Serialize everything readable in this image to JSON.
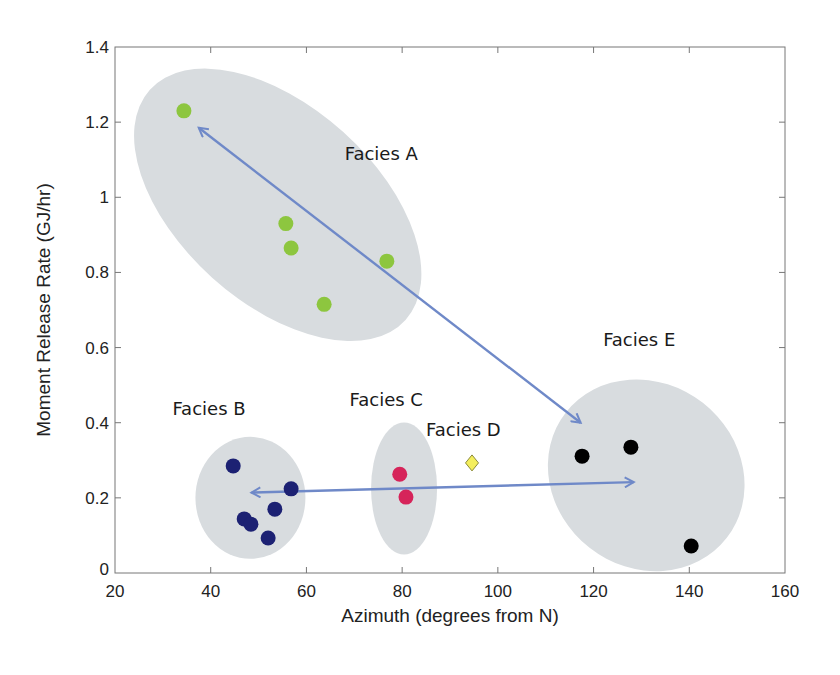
{
  "chart_data": {
    "type": "scatter",
    "title": "",
    "xlabel": "Azimuth (degrees from N)",
    "ylabel": "Moment Release Rate (GJ/hr)",
    "xlim": [
      20,
      160
    ],
    "ylim": [
      0,
      1.4
    ],
    "x_ticks": [
      20,
      40,
      60,
      80,
      100,
      120,
      140,
      160
    ],
    "y_ticks": [
      0,
      0.2,
      0.4,
      0.6,
      0.8,
      1,
      1.2,
      1.4
    ],
    "x_tick_labels": [
      "20",
      "40",
      "60",
      "80",
      "100",
      "120",
      "140",
      "160"
    ],
    "y_tick_labels": [
      "0",
      "0.2",
      "0.4",
      "0.6",
      "0.8",
      "1",
      "1.2",
      "1.4"
    ],
    "grid": false,
    "legend": null,
    "series": [
      {
        "name": "Facies A",
        "marker": "circle",
        "color": "#8dc63f",
        "points": [
          {
            "x": 34.4,
            "y": 1.23
          },
          {
            "x": 55.7,
            "y": 0.93
          },
          {
            "x": 56.8,
            "y": 0.865
          },
          {
            "x": 76.8,
            "y": 0.83
          },
          {
            "x": 63.7,
            "y": 0.715
          }
        ],
        "label_pos": {
          "x": 68,
          "y": 1.1
        },
        "region": {
          "cx": 54,
          "cy": 0.98,
          "rx": 172,
          "ry": 98,
          "rotate": 42
        }
      },
      {
        "name": "Facies B",
        "marker": "circle",
        "color": "#1c2173",
        "points": [
          {
            "x": 44.7,
            "y": 0.285
          },
          {
            "x": 56.8,
            "y": 0.224
          },
          {
            "x": 53.4,
            "y": 0.17
          },
          {
            "x": 47.0,
            "y": 0.144
          },
          {
            "x": 48.4,
            "y": 0.13
          },
          {
            "x": 52.0,
            "y": 0.093
          }
        ],
        "label_pos": {
          "x": 32,
          "y": 0.42
        },
        "region": {
          "cx": 48.3,
          "cy": 0.2,
          "rx": 55,
          "ry": 61,
          "rotate": 0
        }
      },
      {
        "name": "Facies C",
        "marker": "circle",
        "color": "#d6245a",
        "points": [
          {
            "x": 79.5,
            "y": 0.263
          },
          {
            "x": 80.8,
            "y": 0.202
          }
        ],
        "label_pos": {
          "x": 69,
          "y": 0.445
        },
        "region": {
          "cx": 80.4,
          "cy": 0.225,
          "rx": 33,
          "ry": 66,
          "rotate": 0
        }
      },
      {
        "name": "Facies D",
        "marker": "diamond",
        "color": "#f4ee5c",
        "points": [
          {
            "x": 94.6,
            "y": 0.293
          }
        ],
        "label_pos": {
          "x": 85,
          "y": 0.365
        },
        "region": null
      },
      {
        "name": "Facies E",
        "marker": "circle",
        "color": "#000000",
        "points": [
          {
            "x": 117.6,
            "y": 0.311
          },
          {
            "x": 127.8,
            "y": 0.335
          },
          {
            "x": 140.4,
            "y": 0.072
          }
        ],
        "label_pos": {
          "x": 122,
          "y": 0.605
        },
        "region": {
          "cx": 131,
          "cy": 0.26,
          "rx": 102,
          "ry": 92,
          "rotate": 38
        }
      }
    ],
    "annotations": [
      {
        "type": "double-arrow",
        "from": {
          "x": 37.5,
          "y": 1.185
        },
        "to": {
          "x": 117.3,
          "y": 0.4
        },
        "color": "#6f89c8"
      },
      {
        "type": "double-arrow",
        "from": {
          "x": 48.5,
          "y": 0.214
        },
        "to": {
          "x": 128.4,
          "y": 0.242
        },
        "color": "#6f89c8"
      }
    ],
    "region_color": "#d8dcdf"
  }
}
